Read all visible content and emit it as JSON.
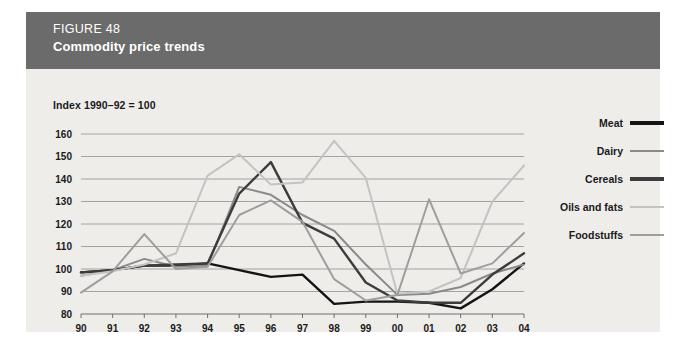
{
  "figure": {
    "number": "FIGURE 48",
    "title": "Commodity price trends",
    "header_bg": "#6b6b6b",
    "card_bg": "#eeedea"
  },
  "axis_note": "Index 1990–92 = 100",
  "legend": {
    "items": [
      {
        "label": "Meat",
        "color": "#141414"
      },
      {
        "label": "Dairy",
        "color": "#8a8a8a"
      },
      {
        "label": "Cereals",
        "color": "#3c3c3c"
      },
      {
        "label": "Oils and fats",
        "color": "#c3c3c3"
      },
      {
        "label": "Foodstuffs",
        "color": "#9e9e9e"
      }
    ]
  },
  "chart_data": {
    "type": "line",
    "title": "Commodity price trends",
    "subtitle": "Index 1990–92 = 100",
    "xlabel": "",
    "ylabel": "",
    "grid": true,
    "legend_position": "right",
    "ylim": [
      80,
      160
    ],
    "yticks": [
      80,
      90,
      100,
      110,
      120,
      130,
      140,
      150,
      160
    ],
    "categories": [
      "90",
      "91",
      "92",
      "93",
      "94",
      "95",
      "96",
      "97",
      "98",
      "99",
      "00",
      "01",
      "02",
      "03",
      "04"
    ],
    "series": [
      {
        "name": "Meat",
        "color": "#141414",
        "values": [
          98.5,
          99.5,
          101.5,
          101.5,
          102.5,
          99.5,
          96.5,
          97.5,
          84.5,
          85.5,
          85.5,
          85.0,
          82.5,
          91.0,
          102.5
        ]
      },
      {
        "name": "Dairy",
        "color": "#8a8a8a",
        "values": [
          97.0,
          99.5,
          104.5,
          101.0,
          101.5,
          136.5,
          133.0,
          124.0,
          117.0,
          102.0,
          88.5,
          89.0,
          92.0,
          98.0,
          102.0
        ]
      },
      {
        "name": "Cereals",
        "color": "#3c3c3c",
        "values": [
          98.5,
          99.5,
          101.5,
          102.0,
          102.5,
          133.5,
          147.5,
          120.5,
          113.5,
          94.0,
          86.0,
          85.0,
          85.0,
          97.5,
          107.0
        ]
      },
      {
        "name": "Oils and fats",
        "color": "#c3c3c3",
        "values": [
          97.0,
          99.0,
          102.0,
          107.0,
          141.5,
          151.0,
          137.5,
          138.5,
          157.0,
          140.5,
          89.0,
          90.0,
          96.0,
          130.0,
          146.0
        ]
      },
      {
        "name": "Foodstuffs",
        "color": "#9e9e9e",
        "values": [
          89.5,
          99.0,
          115.5,
          100.0,
          101.0,
          124.0,
          130.5,
          121.0,
          95.5,
          86.0,
          88.5,
          131.0,
          98.0,
          102.5,
          116.0
        ]
      }
    ]
  }
}
